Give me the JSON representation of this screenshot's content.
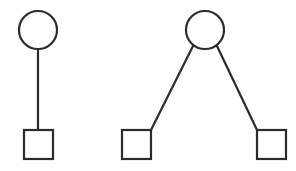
{
  "canvas": {
    "width": 296,
    "height": 171,
    "background_color": "#ffffff",
    "stroke_color": "#2b2b2b",
    "node_fill_color": "#ffffff",
    "stroke_width": 2.2
  },
  "diagram": {
    "title": "",
    "groups": [
      {
        "id": "group-left",
        "name": "single-child-structure",
        "nodes": [
          {
            "id": "left-circle",
            "shape": "circle",
            "role": "parent",
            "label": "",
            "cx": 38,
            "cy": 30,
            "r": 19
          },
          {
            "id": "left-square",
            "shape": "square",
            "role": "child",
            "label": "",
            "x": 24,
            "y": 130,
            "size": 29
          }
        ],
        "edges": [
          {
            "id": "left-edge-1",
            "from": "left-circle",
            "to": "left-square",
            "x1": 38,
            "y1": 49,
            "x2": 38,
            "y2": 130
          }
        ]
      },
      {
        "id": "group-right",
        "name": "two-children-structure",
        "nodes": [
          {
            "id": "right-circle",
            "shape": "circle",
            "role": "parent",
            "label": "",
            "cx": 205,
            "cy": 30,
            "r": 19
          },
          {
            "id": "right-square-left",
            "shape": "square",
            "role": "child",
            "label": "",
            "x": 122,
            "y": 130,
            "size": 29
          },
          {
            "id": "right-square-right",
            "shape": "square",
            "role": "child",
            "label": "",
            "x": 257,
            "y": 130,
            "size": 29
          }
        ],
        "edges": [
          {
            "id": "right-edge-1",
            "from": "right-circle",
            "to": "right-square-left",
            "x1": 193.5,
            "y1": 45,
            "x2": 151,
            "y2": 130
          },
          {
            "id": "right-edge-2",
            "from": "right-circle",
            "to": "right-square-right",
            "x1": 216.5,
            "y1": 45,
            "x2": 257,
            "y2": 130
          }
        ]
      }
    ]
  }
}
